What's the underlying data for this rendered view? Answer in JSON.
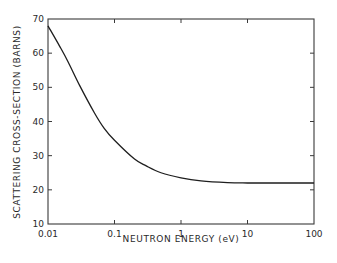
{
  "chart_data": {
    "type": "line",
    "title": "",
    "xlabel": "NEUTRON ENERGY (eV)",
    "ylabel": "SCATTERING CROSS-SECTION (BARNS)",
    "xscale": "log",
    "xlim": [
      0.01,
      100
    ],
    "ylim": [
      10,
      70
    ],
    "xticks": [
      0.01,
      0.1,
      1,
      10,
      100
    ],
    "xtick_labels": [
      "0.01",
      "0.1",
      "1",
      "10",
      "100"
    ],
    "yticks": [
      10,
      20,
      30,
      40,
      50,
      60,
      70
    ],
    "ytick_labels": [
      "10",
      "20",
      "30",
      "40",
      "50",
      "60",
      "70"
    ],
    "grid": false,
    "legend": null,
    "series": [
      {
        "name": "scattering cross-section",
        "x": [
          0.01,
          0.015,
          0.02,
          0.03,
          0.05,
          0.07,
          0.1,
          0.2,
          0.3,
          0.5,
          1,
          2,
          5,
          10,
          30,
          100
        ],
        "y": [
          68,
          62,
          57.5,
          50.5,
          42.5,
          38,
          34.5,
          29,
          27,
          25,
          23.5,
          22.6,
          22.1,
          22,
          22,
          22
        ]
      }
    ]
  }
}
